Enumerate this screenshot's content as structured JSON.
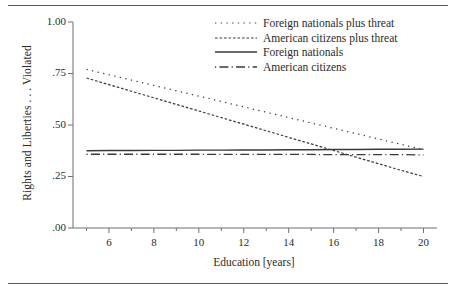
{
  "figure": {
    "has_top_rule": true,
    "has_bottom_rule": true,
    "background": "#ffffff",
    "ink_color": "#3a3a3a"
  },
  "axes": {
    "y": {
      "title": "Rights and Liberties . . . Violated",
      "ticks": [
        ".00",
        ".25",
        ".50",
        ".75",
        "1.00"
      ],
      "tick_values": [
        0.0,
        0.25,
        0.5,
        0.75,
        1.0
      ],
      "range": [
        0.0,
        1.0
      ]
    },
    "x": {
      "title": "Education [years]",
      "ticks": [
        "6",
        "8",
        "10",
        "12",
        "14",
        "16",
        "18",
        "20"
      ],
      "tick_values": [
        6,
        8,
        10,
        12,
        14,
        16,
        18,
        20
      ],
      "minor_tick_values": [
        5,
        7,
        9,
        11,
        13,
        15,
        17,
        19
      ],
      "range": [
        4.4,
        20.6
      ]
    }
  },
  "legend": {
    "position": "top-right",
    "entries": [
      {
        "label": "Foreign nationals plus threat",
        "style": "dotted"
      },
      {
        "label": "American citizens plus threat",
        "style": "dashed"
      },
      {
        "label": "Foreign nationals",
        "style": "solid"
      },
      {
        "label": "American citizens",
        "style": "dash-dot"
      }
    ]
  },
  "chart_data": {
    "type": "line",
    "title": "",
    "xlabel": "Education [years]",
    "ylabel": "Rights and Liberties . . . Violated",
    "xlim": [
      4.4,
      20.6
    ],
    "ylim": [
      0.0,
      1.0
    ],
    "grid": false,
    "legend_position": "top-right",
    "x": [
      5,
      6,
      7,
      8,
      9,
      10,
      11,
      12,
      13,
      14,
      15,
      16,
      17,
      18,
      19,
      20
    ],
    "series": [
      {
        "name": "Foreign nationals plus threat",
        "style": "dotted",
        "values": [
          0.77,
          0.744,
          0.718,
          0.692,
          0.666,
          0.64,
          0.614,
          0.588,
          0.562,
          0.536,
          0.51,
          0.484,
          0.458,
          0.432,
          0.406,
          0.38
        ]
      },
      {
        "name": "American citizens plus threat",
        "style": "dashed",
        "values": [
          0.728,
          0.696,
          0.664,
          0.632,
          0.6,
          0.568,
          0.536,
          0.504,
          0.472,
          0.44,
          0.408,
          0.376,
          0.344,
          0.312,
          0.28,
          0.25
        ]
      },
      {
        "name": "Foreign nationals",
        "style": "solid",
        "values": [
          0.375,
          0.376,
          0.376,
          0.377,
          0.377,
          0.378,
          0.378,
          0.379,
          0.379,
          0.38,
          0.38,
          0.381,
          0.381,
          0.382,
          0.382,
          0.383
        ]
      },
      {
        "name": "American citizens",
        "style": "dash-dot",
        "values": [
          0.358,
          0.358,
          0.358,
          0.358,
          0.358,
          0.358,
          0.357,
          0.357,
          0.357,
          0.357,
          0.357,
          0.356,
          0.356,
          0.356,
          0.356,
          0.355
        ]
      }
    ],
    "annotations": [
      "Dotted and dashed threat lines decline with education and cross the two flat lines near 16 years."
    ]
  }
}
